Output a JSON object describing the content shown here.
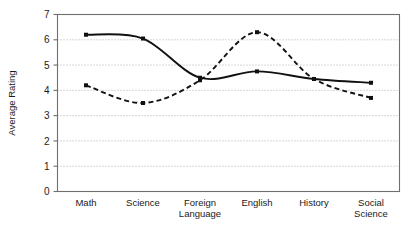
{
  "chart_data": {
    "type": "line",
    "title": "",
    "xlabel": "",
    "ylabel": "Average Rating",
    "ylim": [
      0,
      7
    ],
    "yticks": [
      0,
      1,
      2,
      3,
      4,
      5,
      6,
      7
    ],
    "ytick_labels": [
      "0",
      "1",
      "2",
      "3",
      "4",
      "5",
      "6",
      "7"
    ],
    "grid": "horizontal-dotted",
    "legend": "none",
    "categories": [
      "Math",
      "Science",
      "Foreign Language",
      "English",
      "History",
      "Social Science"
    ],
    "category_lines": [
      [
        "Math"
      ],
      [
        "Science"
      ],
      [
        "Foreign",
        "Language"
      ],
      [
        "English"
      ],
      [
        "History"
      ],
      [
        "Social",
        "Science"
      ]
    ],
    "series": [
      {
        "name": "series-solid",
        "style": "solid",
        "marker": "square",
        "color": "#111111",
        "values": [
          6.2,
          6.05,
          4.5,
          4.75,
          4.45,
          4.3
        ]
      },
      {
        "name": "series-dashed",
        "style": "dashed",
        "marker": "square",
        "color": "#111111",
        "values": [
          4.2,
          3.5,
          4.4,
          6.3,
          4.45,
          3.7
        ]
      }
    ]
  },
  "colors": {
    "ink": "#111111",
    "axis": "#6f6f6f",
    "grid": "#9a9a9a",
    "background": "#ffffff"
  }
}
